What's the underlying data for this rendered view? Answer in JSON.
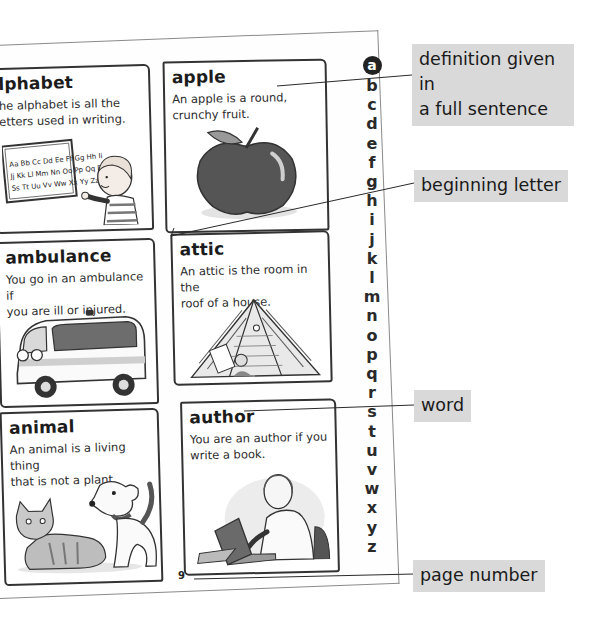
{
  "page": {
    "number": "9",
    "entries": [
      {
        "word": "alphabet",
        "visible_word": "lphabet",
        "definition": "The alphabet is all the letters used in writing.",
        "visible_definition_lines": [
          "he alphabet is all the",
          "etters used in writing."
        ],
        "illustration": "boy pointing at alphabet chart",
        "chart_rows": [
          "Aa Bb Cc Dd Ee Ff Gg Hh Ii",
          "Jj Kk Ll Mm Nn Oo Pp Qq Rr",
          "Ss Tt Uu Vv Ww Xx Yy Zz"
        ]
      },
      {
        "word": "ambulance",
        "definition_lines": [
          "You go in an ambulance if",
          "you are ill or injured."
        ],
        "illustration": "ambulance van"
      },
      {
        "word": "animal",
        "definition_lines": [
          "An animal is a living thing",
          "that is not a plant."
        ],
        "illustration": "cat and dog"
      },
      {
        "word": "apple",
        "definition_lines": [
          "An apple is a round,",
          "crunchy fruit."
        ],
        "illustration": "apple"
      },
      {
        "word": "attic",
        "definition_lines": [
          "An attic is the room in the",
          "roof of a house."
        ],
        "illustration": "attic room"
      },
      {
        "word": "author",
        "definition_lines": [
          "You are an author if you",
          "write a book."
        ],
        "illustration": "man typing on laptop"
      }
    ],
    "alphabet": [
      "a",
      "b",
      "c",
      "d",
      "e",
      "f",
      "g",
      "h",
      "i",
      "j",
      "k",
      "l",
      "m",
      "n",
      "o",
      "p",
      "q",
      "r",
      "s",
      "t",
      "u",
      "v",
      "w",
      "x",
      "y",
      "z"
    ],
    "active_letter": "a"
  },
  "callouts": [
    {
      "id": "definition",
      "lines": [
        "definition given in",
        "a full sentence"
      ]
    },
    {
      "id": "beginning-letter",
      "lines": [
        "beginning letter"
      ]
    },
    {
      "id": "word",
      "lines": [
        "word"
      ]
    },
    {
      "id": "page-number",
      "lines": [
        "page number"
      ]
    }
  ],
  "colors": {
    "callout_bg": "#d9d9d9",
    "ink": "#1c1c1c",
    "active_letter_bg": "#222222"
  }
}
